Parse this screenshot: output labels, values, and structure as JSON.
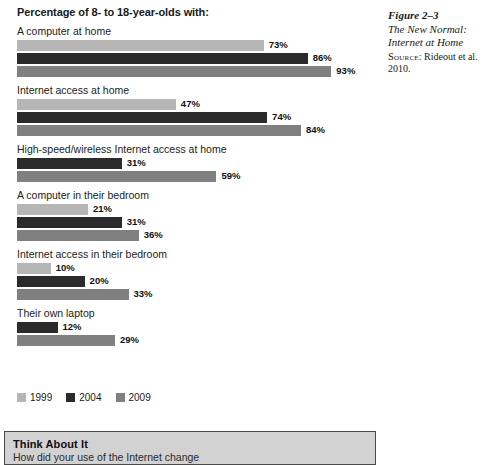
{
  "chart_data": {
    "type": "bar",
    "title": "Percentage of 8- to 18-year-olds with:",
    "orientation": "horizontal",
    "xlabel": "",
    "ylabel": "",
    "xlim": [
      0,
      100
    ],
    "grid": false,
    "legend_position": "bottom-left",
    "value_suffix": "%",
    "categories": [
      "A computer at home",
      "Internet access at home",
      "High-speed/wireless Internet access at home",
      "A computer in their bedroom",
      "Internet access in their bedroom",
      "Their own laptop"
    ],
    "series": [
      {
        "name": "1999",
        "color": "#b6b6b6",
        "values": [
          73,
          47,
          null,
          21,
          10,
          null
        ]
      },
      {
        "name": "2004",
        "color": "#2b2b2b",
        "values": [
          86,
          74,
          31,
          31,
          20,
          12
        ]
      },
      {
        "name": "2009",
        "color": "#808080",
        "values": [
          93,
          84,
          59,
          36,
          33,
          29
        ]
      }
    ],
    "groups": [
      {
        "label": "A computer at home",
        "bars": [
          {
            "year": "1999",
            "value": 73,
            "label": "73%",
            "color": "#b6b6b6"
          },
          {
            "year": "2004",
            "value": 86,
            "label": "86%",
            "color": "#2b2b2b"
          },
          {
            "year": "2009",
            "value": 93,
            "label": "93%",
            "color": "#808080"
          }
        ]
      },
      {
        "label": "Internet access at home",
        "bars": [
          {
            "year": "1999",
            "value": 47,
            "label": "47%",
            "color": "#b6b6b6"
          },
          {
            "year": "2004",
            "value": 74,
            "label": "74%",
            "color": "#2b2b2b"
          },
          {
            "year": "2009",
            "value": 84,
            "label": "84%",
            "color": "#808080"
          }
        ]
      },
      {
        "label": "High-speed/wireless Internet access at home",
        "bars": [
          {
            "year": "2004",
            "value": 31,
            "label": "31%",
            "color": "#2b2b2b"
          },
          {
            "year": "2009",
            "value": 59,
            "label": "59%",
            "color": "#808080"
          }
        ]
      },
      {
        "label": "A computer in their bedroom",
        "bars": [
          {
            "year": "1999",
            "value": 21,
            "label": "21%",
            "color": "#b6b6b6"
          },
          {
            "year": "2004",
            "value": 31,
            "label": "31%",
            "color": "#2b2b2b"
          },
          {
            "year": "2009",
            "value": 36,
            "label": "36%",
            "color": "#808080"
          }
        ]
      },
      {
        "label": "Internet access in their bedroom",
        "bars": [
          {
            "year": "1999",
            "value": 10,
            "label": "10%",
            "color": "#b6b6b6"
          },
          {
            "year": "2004",
            "value": 20,
            "label": "20%",
            "color": "#2b2b2b"
          },
          {
            "year": "2009",
            "value": 33,
            "label": "33%",
            "color": "#808080"
          }
        ]
      },
      {
        "label": "Their own laptop",
        "bars": [
          {
            "year": "2004",
            "value": 12,
            "label": "12%",
            "color": "#2b2b2b"
          },
          {
            "year": "2009",
            "value": 29,
            "label": "29%",
            "color": "#808080"
          }
        ]
      }
    ],
    "legend": [
      {
        "label": "1999",
        "color": "#b6b6b6"
      },
      {
        "label": "2004",
        "color": "#2b2b2b"
      },
      {
        "label": "2009",
        "color": "#808080"
      }
    ]
  },
  "caption": {
    "figure_number": "Figure 2–3",
    "title_line_1": "The New Normal:",
    "title_line_2": "Internet at Home",
    "source_label": "Source",
    "source_text": ": Rideout et al. 2010."
  },
  "think_box": {
    "title": "Think About It",
    "body": "How did your use of the Internet change"
  }
}
